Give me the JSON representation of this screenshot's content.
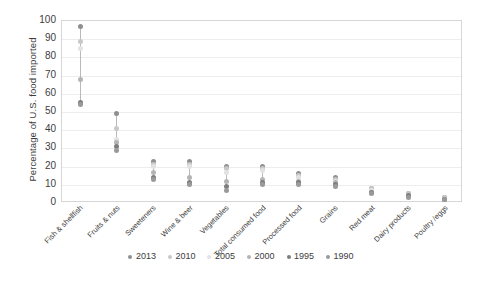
{
  "chart_data": {
    "type": "scatter",
    "title": "",
    "xlabel": "",
    "ylabel": "Percentage of U.S. food imported",
    "ylim": [
      0,
      100
    ],
    "yticks": [
      100,
      90,
      80,
      70,
      60,
      50,
      40,
      30,
      20,
      10,
      0
    ],
    "grid": true,
    "legend_position": "bottom",
    "categories": [
      "Fish & shellfish",
      "Fruits & nuts",
      "Sweeteners",
      "Wine & beer",
      "Vegetables",
      "Total consumed food",
      "Processed food",
      "Grains",
      "Red meat",
      "Dairy products",
      "Poultry /eggs"
    ],
    "series": [
      {
        "name": "2013",
        "color": "#8f8f8f",
        "values": [
          97,
          49,
          23,
          23,
          20,
          20,
          16,
          14,
          8,
          5,
          3
        ]
      },
      {
        "name": "2010",
        "color": "#c8c8c8",
        "values": [
          89,
          41,
          21,
          21,
          19,
          19,
          15,
          13,
          8,
          5,
          3
        ]
      },
      {
        "name": "2005",
        "color": "#e2e2e2",
        "values": [
          85,
          35,
          20,
          20,
          17,
          18,
          14,
          12,
          7,
          4,
          2
        ]
      },
      {
        "name": "2000",
        "color": "#b4b4b4",
        "values": [
          68,
          33,
          17,
          14,
          12,
          13,
          12,
          11,
          6,
          4,
          2
        ]
      },
      {
        "name": "1995",
        "color": "#7d7d7d",
        "values": [
          55,
          31,
          14,
          11,
          9,
          11,
          11,
          10,
          6,
          4,
          2
        ]
      },
      {
        "name": "1990",
        "color": "#9a9a9a",
        "values": [
          54,
          29,
          13,
          10,
          7,
          10,
          10,
          9,
          5,
          3,
          2
        ]
      }
    ]
  },
  "legend": {
    "items": [
      {
        "label": "2013"
      },
      {
        "label": "2010"
      },
      {
        "label": "2005"
      },
      {
        "label": "2000"
      },
      {
        "label": "1995"
      },
      {
        "label": "1990"
      }
    ]
  }
}
